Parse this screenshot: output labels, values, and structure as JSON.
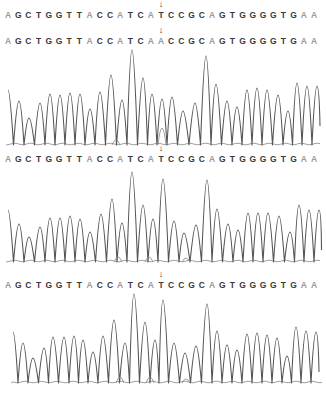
{
  "chart_data": {
    "type": "line",
    "title": "",
    "reference_sequence": "AGCTGGTTACCATCATCCGCAGTGGGGTGAA",
    "sequences": [
      {
        "label": "seq1",
        "bases": "AGCTGGTTACCATCATCCGCAGTGGGGTGAA",
        "arrow_index": 15,
        "top": 8
      },
      {
        "label": "seq2",
        "bases": "AGCTGGTTACCATCAACCGCAGTGGGGTGAA",
        "arrow_index": 15,
        "top": 34
      },
      {
        "label": "seq3",
        "bases": "AGCTGGTTACCATCATCCGCAGTGGGGTGAA",
        "arrow_index": 15,
        "top": 152
      },
      {
        "label": "seq4",
        "bases": "AGCTGGTTACCATCATCCGCAGTGGGGTGAA",
        "arrow_index": 15,
        "top": 278
      }
    ],
    "base_x_start": 8,
    "base_x_step": 10.2,
    "chromatograms": [
      {
        "top": 48,
        "baseline": 145,
        "height": 100,
        "peaks_x": [
          8,
          19,
          29,
          40,
          50,
          60,
          70,
          80,
          90,
          100,
          111,
          122,
          132,
          143,
          152,
          162,
          172,
          183,
          195,
          206,
          216,
          227,
          237,
          247,
          257,
          267,
          278,
          288,
          297,
          307,
          317
        ],
        "peaks_y": [
          90,
          101,
          118,
          103,
          94,
          95,
          93,
          94,
          109,
          92,
          75,
          100,
          50,
          78,
          94,
          99,
          97,
          111,
          103,
          56,
          84,
          101,
          107,
          90,
          88,
          90,
          95,
          111,
          83,
          86,
          86
        ],
        "minor_peaks": [
          {
            "x": 162,
            "y": 128
          },
          {
            "x": 116,
            "y": 140
          }
        ]
      },
      {
        "top": 168,
        "baseline": 262,
        "height": 96,
        "peaks_x": [
          8,
          19,
          29,
          40,
          50,
          60,
          70,
          80,
          90,
          101,
          112,
          122,
          132,
          143,
          153,
          163,
          174,
          184,
          196,
          207,
          217,
          228,
          238,
          248,
          258,
          268,
          279,
          290,
          299,
          309,
          319
        ],
        "peaks_y": [
          210,
          224,
          237,
          227,
          218,
          218,
          216,
          219,
          232,
          214,
          199,
          223,
          172,
          205,
          219,
          179,
          221,
          233,
          225,
          180,
          209,
          224,
          230,
          213,
          213,
          213,
          216,
          232,
          205,
          210,
          210
        ],
        "minor_peaks": [
          {
            "x": 118,
            "y": 257
          },
          {
            "x": 149,
            "y": 257
          },
          {
            "x": 186,
            "y": 258
          }
        ]
      },
      {
        "top": 290,
        "baseline": 383,
        "height": 96,
        "peaks_x": [
          13,
          23,
          33,
          44,
          53,
          64,
          74,
          83,
          93,
          103,
          114,
          125,
          134,
          145,
          155,
          163,
          174,
          185,
          196,
          207,
          217,
          227,
          237,
          247,
          257,
          267,
          277,
          287,
          296,
          306,
          316
        ],
        "peaks_y": [
          332,
          343,
          358,
          348,
          337,
          337,
          336,
          340,
          352,
          336,
          320,
          343,
          294,
          322,
          340,
          300,
          343,
          353,
          346,
          304,
          331,
          345,
          350,
          334,
          333,
          335,
          338,
          356,
          327,
          331,
          332
        ],
        "minor_peaks": [
          {
            "x": 120,
            "y": 377
          },
          {
            "x": 150,
            "y": 377
          },
          {
            "x": 186,
            "y": 379
          }
        ]
      }
    ],
    "colors": {
      "trace": "#555555",
      "base_A": "#9a9a9a",
      "base_other": "#3a3a3a",
      "arrow": "#333333"
    },
    "arrow_glyph": "↓"
  }
}
